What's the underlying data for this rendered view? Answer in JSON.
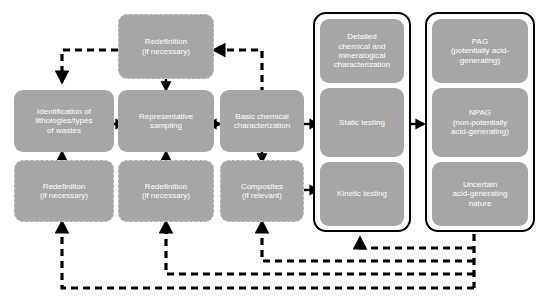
{
  "diagram": {
    "canvas": {
      "width": 541,
      "height": 298
    },
    "colors": {
      "node_fill": "#a6a6a6",
      "node_text": "#ffffff",
      "dashed_border": "#d2d2d2",
      "container_border": "#000000",
      "edge_solid": "#000000",
      "edge_dashed": "#000000",
      "background": "#ffffff"
    }
  },
  "nodes": {
    "redefinition_top": "Redefinition\n(if necessary)",
    "identification": "Identification of\nlithologies/types\nof wastes",
    "representative_sampling": "Representative\nsampling",
    "basic_chemical": "Basic chemical\ncharacterization",
    "redefinition_left": "Redefinition\n(if necessary)",
    "redefinition_mid": "Redefinition\n(if necessary)",
    "composites": "Composites\n(if relevant)",
    "detailed_characterization": "Detailed\nchemical and\nmineralogical\ncharacterization",
    "static_testing": "Static testing",
    "kinetic_testing": "Kinetic testing",
    "pag": "PAG\n(potentially  acid-\ngenerating)",
    "npag": "NPAG\n(non-potentially\nacid-generating)",
    "uncertain": "Uncertain\nacid-generating\nnature"
  },
  "containers": {
    "testing_group": "testing-group-container",
    "classification_group": "classification-group-container"
  },
  "edges": [
    {
      "name": "identification-to-sampling",
      "style": "solid"
    },
    {
      "name": "sampling-to-basic-chemical",
      "style": "solid"
    },
    {
      "name": "basic-chemical-to-static-testing",
      "style": "solid"
    },
    {
      "name": "testing-group-to-classification-group",
      "style": "solid"
    },
    {
      "name": "redefinition-top-to-sampling",
      "style": "solid"
    },
    {
      "name": "redefinition-left-to-identification",
      "style": "solid"
    },
    {
      "name": "redefinition-mid-to-sampling",
      "style": "solid"
    },
    {
      "name": "basic-chemical-to-composites",
      "style": "solid"
    },
    {
      "name": "composites-to-kinetic-testing",
      "style": "solid"
    },
    {
      "name": "basic-chemical-to-redefinition-top",
      "style": "dashed"
    },
    {
      "name": "redefinition-top-to-identification",
      "style": "dashed"
    },
    {
      "name": "classification-to-redefinition-left",
      "style": "dashed"
    },
    {
      "name": "classification-to-redefinition-mid",
      "style": "dashed"
    },
    {
      "name": "classification-to-composites",
      "style": "dashed"
    },
    {
      "name": "classification-to-testing-group",
      "style": "dashed"
    }
  ]
}
